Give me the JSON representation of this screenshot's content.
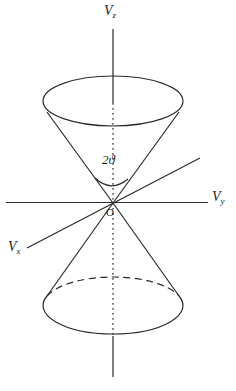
{
  "figure": {
    "labels": {
      "z_axis": {
        "main": "V",
        "sub": "z"
      },
      "y_axis": {
        "main": "V",
        "sub": "y"
      },
      "x_axis": {
        "main": "V",
        "sub": "x"
      },
      "angle": "2ϑ",
      "origin": "O"
    },
    "colors": {
      "line": "#2b2b2b",
      "background": "#ffffff"
    }
  }
}
